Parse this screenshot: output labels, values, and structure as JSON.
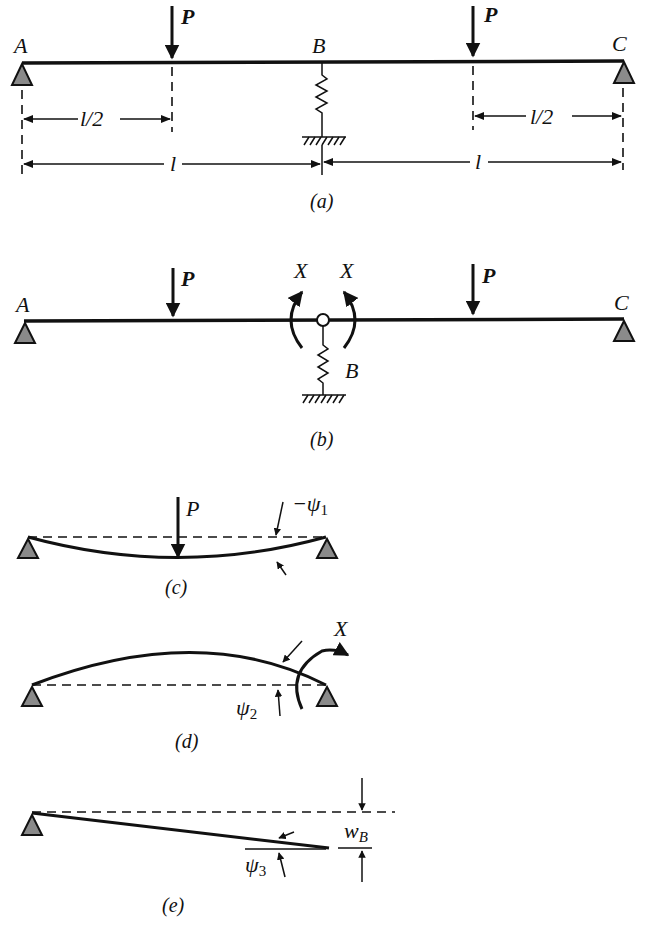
{
  "figure": {
    "panels": [
      {
        "id": "a",
        "caption": "(a)",
        "description": "Two-span beam A-B-C with spring support at B and point loads P at midspans",
        "labels": {
          "A": "A",
          "B": "B",
          "C": "C",
          "P_left": "P",
          "P_right": "P"
        },
        "dimensions": {
          "half_left": "l/2",
          "half_right": "l/2",
          "span_left": "l",
          "span_right": "l"
        }
      },
      {
        "id": "b",
        "caption": "(b)",
        "description": "Released structure with hinge at B and redundant moments X",
        "labels": {
          "A": "A",
          "B": "B",
          "C": "C",
          "P_left": "P",
          "P_right": "P",
          "X_left": "X",
          "X_right": "X"
        }
      },
      {
        "id": "c",
        "caption": "(c)",
        "description": "Simply supported span under load P, end rotation -ψ1",
        "labels": {
          "P": "P",
          "psi": "−ψ",
          "psi_sub": "1"
        }
      },
      {
        "id": "d",
        "caption": "(d)",
        "description": "Simply supported span under end moment X, end rotation ψ2",
        "labels": {
          "X": "X",
          "psi": "ψ",
          "psi_sub": "2"
        }
      },
      {
        "id": "e",
        "caption": "(e)",
        "description": "Rigid-body rotation ψ3 due to support settlement w_B",
        "labels": {
          "psi": "ψ",
          "psi_sub": "3",
          "w": "w",
          "w_sub": "B"
        }
      }
    ]
  }
}
